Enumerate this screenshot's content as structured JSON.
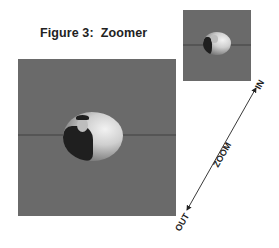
{
  "figure": {
    "title": "Figure 3:  Zoomer",
    "arrow": {
      "label": "ZOOM",
      "end_in": "IN",
      "end_out": "OUT"
    },
    "panels": [
      {
        "name": "zoomed-out-view",
        "size": "large"
      },
      {
        "name": "zoomed-in-view",
        "size": "small"
      }
    ],
    "colors": {
      "panel_gray": "#6a6a6a",
      "text": "#222222"
    }
  }
}
